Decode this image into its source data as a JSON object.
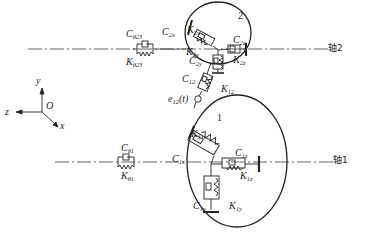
{
  "diagram": {
    "type": "gear-pair dynamic model schematic",
    "shafts": [
      {
        "id": "shaft2",
        "label": "轴2"
      },
      {
        "id": "shaft1",
        "label": "轴1"
      }
    ],
    "gears": [
      {
        "id": "gear2",
        "label": "2"
      },
      {
        "id": "gear1",
        "label": "1"
      }
    ],
    "coordinate_system": {
      "x": "x",
      "y": "y",
      "z": "z",
      "origin": "O"
    },
    "labels": {
      "C_theta23": {
        "main": "C",
        "sub": "θ23"
      },
      "K_theta23": {
        "main": "K",
        "sub": "θ23"
      },
      "C_2x_left": {
        "main": "C",
        "sub": "2x"
      },
      "K_2x_top": {
        "main": "K",
        "sub": "2x"
      },
      "K_2y": {
        "main": "K",
        "sub": "2y"
      },
      "C_2y": {
        "main": "C",
        "sub": "2y"
      },
      "C_2z": {
        "main": "C",
        "sub": "2z"
      },
      "K_2z": {
        "main": "K",
        "sub": "2z"
      },
      "C_12": {
        "main": "C",
        "sub": "12"
      },
      "K_12": {
        "main": "K",
        "sub": "12"
      },
      "e_12": {
        "main": "e",
        "sub": "12",
        "suffix": "(t)"
      },
      "K_1x": {
        "main": "K",
        "sub": "1x"
      },
      "C_1x": {
        "main": "C",
        "sub": "1x"
      },
      "C_1z": {
        "main": "C",
        "sub": "1z"
      },
      "K_1z": {
        "main": "K",
        "sub": "1z"
      },
      "C_theta1": {
        "main": "C",
        "sub": "θ1"
      },
      "K_theta1": {
        "main": "K",
        "sub": "θ1"
      },
      "C_1y": {
        "main": "C",
        "sub": "1y"
      },
      "K_1y": {
        "main": "K",
        "sub": "1y"
      }
    },
    "colors": {
      "stroke": "#222222",
      "background": "#ffffff"
    }
  }
}
